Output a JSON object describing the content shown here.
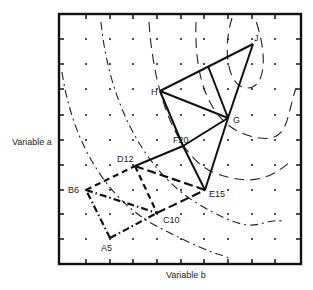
{
  "diagram": {
    "type": "simplex-optimization-contour-plot",
    "xlabel": "Variable b",
    "ylabel": "Variable a",
    "frame": {
      "x": 59,
      "y": 14,
      "width": 242,
      "height": 250
    },
    "grid": {
      "xs": [
        86,
        110,
        133,
        157,
        181,
        204,
        228,
        252,
        275
      ],
      "ys": [
        39,
        64,
        89,
        115,
        140,
        165,
        190,
        214,
        239
      ]
    },
    "ticks": {
      "x": [
        86,
        110,
        133,
        157,
        181,
        204,
        228,
        252,
        275
      ],
      "y": [
        39,
        64,
        89,
        115,
        140,
        165,
        190,
        214,
        239
      ]
    },
    "vertices": [
      {
        "id": "A5",
        "label": "A5",
        "x": 110,
        "y": 238,
        "lx": 101,
        "ly": 251
      },
      {
        "id": "B6",
        "label": "B6",
        "x": 86,
        "y": 190,
        "lx": 68,
        "ly": 193
      },
      {
        "id": "C10",
        "label": "C10",
        "x": 157,
        "y": 213,
        "lx": 163,
        "ly": 223
      },
      {
        "id": "D12",
        "label": "D12",
        "x": 135,
        "y": 166,
        "lx": 117,
        "ly": 162
      },
      {
        "id": "E15",
        "label": "E15",
        "x": 205,
        "y": 190,
        "lx": 209,
        "ly": 197
      },
      {
        "id": "F20",
        "label": "F20",
        "x": 183,
        "y": 146,
        "lx": 173,
        "ly": 143
      },
      {
        "id": "G",
        "label": "G",
        "x": 228,
        "y": 118,
        "lx": 233,
        "ly": 123
      },
      {
        "id": "H",
        "label": "H",
        "x": 160,
        "y": 91,
        "lx": 151,
        "ly": 95
      },
      {
        "id": "J",
        "label": "J",
        "x": 253,
        "y": 44,
        "lx": 254,
        "ly": 41
      }
    ],
    "edges": [
      {
        "from": "A5",
        "to": "B6",
        "style": "dashdot"
      },
      {
        "from": "A5",
        "to": "C10",
        "style": "dashdot"
      },
      {
        "from": "B6",
        "to": "C10",
        "style": "dashdot"
      },
      {
        "from": "B6",
        "to": "D12",
        "style": "dashed"
      },
      {
        "from": "D12",
        "to": "C10",
        "style": "dashed"
      },
      {
        "from": "C10",
        "to": "E15",
        "style": "longdash"
      },
      {
        "from": "D12",
        "to": "E15",
        "style": "longdash"
      },
      {
        "from": "D12",
        "to": "F20",
        "style": "solid"
      },
      {
        "from": "F20",
        "to": "E15",
        "style": "solid"
      },
      {
        "from": "F20",
        "to": "G",
        "style": "solid"
      },
      {
        "from": "E15",
        "to": "G",
        "style": "solid"
      },
      {
        "from": "H",
        "to": "F20",
        "style": "solid"
      },
      {
        "from": "H",
        "to": "G",
        "style": "solid"
      },
      {
        "from": "H",
        "to": "J",
        "style": "solid"
      },
      {
        "from": "G",
        "to": "J",
        "style": "solid"
      },
      {
        "from": "HJmid",
        "to": "G",
        "style": "solid"
      }
    ],
    "aux_points": [
      {
        "id": "HJmid",
        "x": 208,
        "y": 66
      }
    ],
    "contours": [
      {
        "name": "contour-1-outer",
        "style": "dashdot",
        "d": "M 62 72 C 72 140, 105 200, 160 228 S 215 252, 232 259"
      },
      {
        "name": "contour-2",
        "style": "dashdot",
        "d": "M 101 22 C 108 95, 140 170, 200 205 S 255 218, 283 221"
      },
      {
        "name": "contour-3",
        "style": "dashed",
        "d": "M 149 22 C 154 100, 180 160, 215 173 S 270 180, 292 160"
      },
      {
        "name": "contour-4",
        "style": "dashed",
        "d": "M 196 22 C 194 80, 210 125, 250 136 S 285 120, 296 88"
      },
      {
        "name": "contour-5-inner",
        "style": "dashed",
        "d": "M 232 18 C 222 50, 228 88, 247 88 S 268 55, 255 18"
      }
    ]
  }
}
